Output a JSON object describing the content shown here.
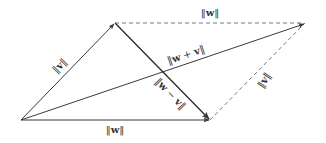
{
  "diagram": {
    "colors": {
      "solid": "#3a3a3a",
      "dashed": "#6a6a6a",
      "label": "#333333",
      "background": "#ffffff"
    },
    "points": {
      "origin": [
        21,
        120
      ],
      "v_tip": [
        115,
        23
      ],
      "w_tip": [
        210,
        120
      ],
      "sum_tip": [
        305,
        23
      ]
    },
    "labels": {
      "w_top": {
        "pre": "‖",
        "var": "w",
        "post": "‖"
      },
      "v_left": {
        "pre": "‖",
        "var": "v",
        "post": "‖"
      },
      "sum": {
        "pre": "‖",
        "var1": "w",
        "op": " + ",
        "var2": "v",
        "post": "‖"
      },
      "diff": {
        "pre": "‖",
        "var1": "w",
        "op": " − ",
        "var2": "v",
        "post": "‖"
      },
      "v_right": {
        "pre": "‖",
        "var": "v",
        "post": "‖"
      },
      "w_bottom": {
        "pre": "‖",
        "var": "w",
        "post": "‖"
      }
    }
  }
}
